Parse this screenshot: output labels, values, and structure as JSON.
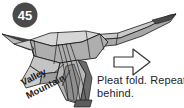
{
  "step": {
    "number": "45",
    "badge_color": "#4a4a4a",
    "badge_text_color": "#ffffff"
  },
  "diagram": {
    "name": "origami-pleat-fold-step",
    "paper_light": "#d9d9d9",
    "paper_mid": "#ababab",
    "paper_dark": "#8a8a8a",
    "paper_shadow": "#6f6f6f",
    "line_color": "#1b1b1b",
    "background": "#ffffff",
    "labels": {
      "valley": "Valley",
      "mountain": "Mountain"
    }
  },
  "arrow": {
    "name": "right-arrow-icon",
    "direction": "right",
    "stroke": "#333333",
    "fill": "#ffffff"
  },
  "caption": {
    "line1": "Pleat fold. Repeat",
    "line2": "behind."
  }
}
